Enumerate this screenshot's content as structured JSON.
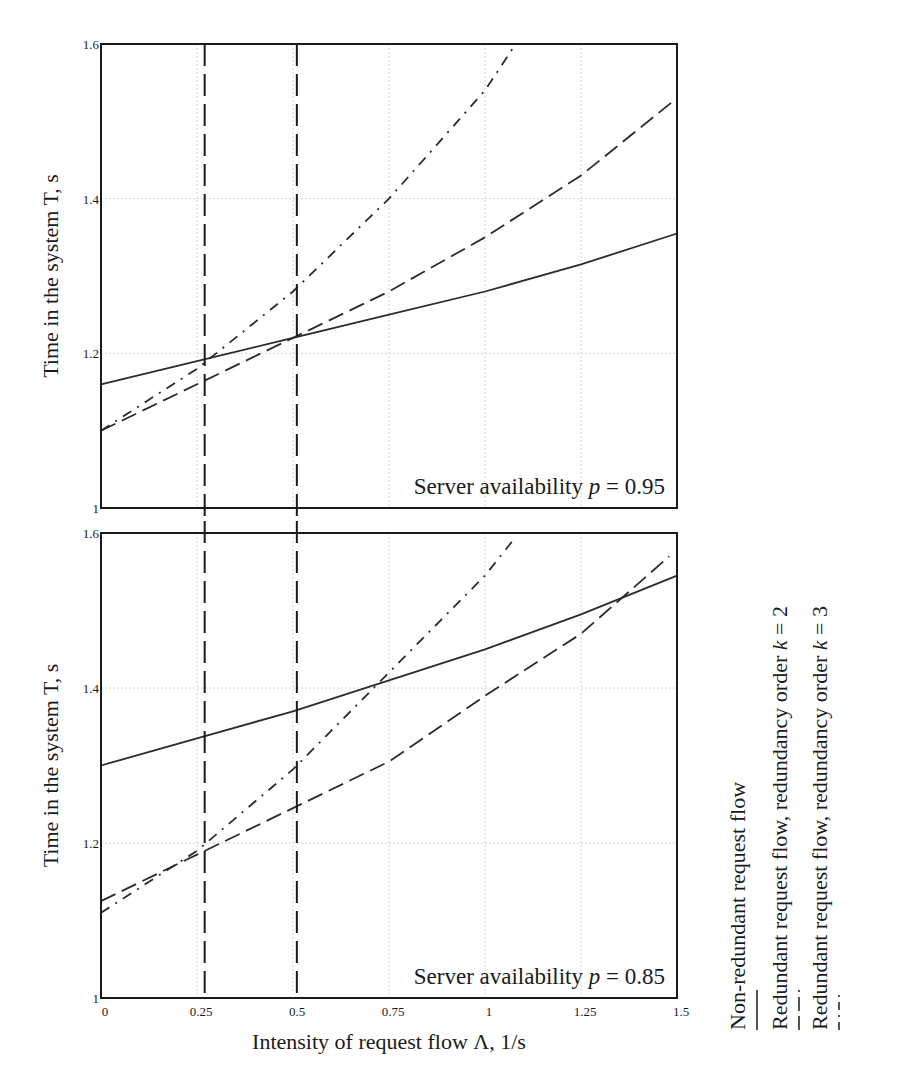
{
  "chart_data": [
    {
      "type": "line",
      "panel": "top",
      "annotation": "Server availability p = 0.95",
      "annotation_parts": {
        "prefix": "Server availability ",
        "var": "p",
        "suffix": " = 0.95"
      },
      "xlabel": "Intensity of request flow Λ, 1/s",
      "ylabel": "Time in the system T, s",
      "xlim": [
        0,
        1.5
      ],
      "ylim": [
        1,
        1.6
      ],
      "x_ticks": [
        "0",
        "0.25",
        "0.5",
        "0.75",
        "1",
        "1.25",
        "1.5"
      ],
      "y_ticks": [
        "1",
        "1.2",
        "1.4",
        "1.6"
      ],
      "grid": true,
      "vertical_markers": [
        0.27,
        0.51
      ],
      "series": [
        {
          "name": "Non-redundant request flow",
          "style": "solid",
          "x": [
            0,
            0.25,
            0.5,
            0.75,
            1.0,
            1.25,
            1.5
          ],
          "values": [
            1.16,
            1.19,
            1.22,
            1.25,
            1.28,
            1.315,
            1.355
          ]
        },
        {
          "name": "Redundant request flow, redundancy order k = 2",
          "style": "dashed",
          "x": [
            0,
            0.25,
            0.5,
            0.75,
            1.0,
            1.25,
            1.5
          ],
          "values": [
            1.1,
            1.16,
            1.22,
            1.28,
            1.35,
            1.43,
            1.53
          ]
        },
        {
          "name": "Redundant request flow, redundancy order k = 3",
          "style": "dash-dot",
          "x": [
            0,
            0.25,
            0.5,
            0.75,
            1.0,
            1.08
          ],
          "values": [
            1.1,
            1.18,
            1.28,
            1.4,
            1.54,
            1.6
          ]
        }
      ]
    },
    {
      "type": "line",
      "panel": "bottom",
      "annotation": "Server availability p = 0.85",
      "annotation_parts": {
        "prefix": "Server availability ",
        "var": "p",
        "suffix": " = 0.85"
      },
      "xlabel": "Intensity of request flow Λ, 1/s",
      "ylabel": "Time in the system T, s",
      "xlim": [
        0,
        1.5
      ],
      "ylim": [
        1,
        1.6
      ],
      "x_ticks": [
        "0",
        "0.25",
        "0.5",
        "0.75",
        "1",
        "1.25",
        "1.5"
      ],
      "y_ticks": [
        "1",
        "1.2",
        "1.4",
        "1.6"
      ],
      "grid": true,
      "vertical_markers": [
        0.27,
        0.51
      ],
      "series": [
        {
          "name": "Non-redundant request flow",
          "style": "solid",
          "x": [
            0,
            0.25,
            0.5,
            0.75,
            1.0,
            1.25,
            1.5
          ],
          "values": [
            1.3,
            1.335,
            1.37,
            1.41,
            1.45,
            1.495,
            1.545
          ]
        },
        {
          "name": "Redundant request flow, redundancy order k = 2",
          "style": "dashed",
          "x": [
            0,
            0.25,
            0.5,
            0.75,
            1.0,
            1.25,
            1.48
          ],
          "values": [
            1.125,
            1.185,
            1.245,
            1.305,
            1.39,
            1.47,
            1.57
          ]
        },
        {
          "name": "Redundant request flow, redundancy order k = 3",
          "style": "dash-dot",
          "x": [
            0,
            0.25,
            0.5,
            0.75,
            1.0,
            1.08
          ],
          "values": [
            1.11,
            1.19,
            1.295,
            1.42,
            1.545,
            1.595
          ]
        }
      ]
    }
  ],
  "axes": {
    "xlabel": "Intensity of request flow Λ, 1/s",
    "ylabel": "Time in the system T, s"
  },
  "legend": {
    "position": "right, rotated vertical",
    "items": [
      {
        "label": "Non-redundant request flow",
        "style": "solid"
      },
      {
        "label": "Redundant request flow, redundancy order k = 2",
        "label_prefix": "Redundant request flow, redundancy order ",
        "var": "k",
        "label_suffix": " = 2",
        "style": "dashed"
      },
      {
        "label": "Redundant request flow, redundancy order k = 3",
        "label_prefix": "Redundant request flow, redundancy order ",
        "var": "k",
        "label_suffix": " = 3",
        "style": "dash-dot"
      }
    ]
  },
  "colors": {
    "line": "#2b2b2b",
    "frame": "#1a1a1a",
    "grid": "#d4d4d4",
    "background": "#ffffff"
  }
}
